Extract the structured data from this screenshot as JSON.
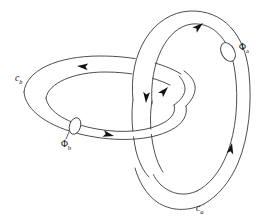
{
  "figure": {
    "background_color": "#ffffff",
    "line_color": "#3a3a3a",
    "arrow_color": "#111111"
  },
  "labels": {
    "loop_a": {
      "symbol": "c",
      "subscript": "a",
      "x": 198,
      "y": 209
    },
    "loop_b": {
      "symbol": "c",
      "subscript": "b",
      "x": 15,
      "y": 80
    },
    "flux_a": {
      "symbol": "Φ",
      "subscript": "a",
      "x": 240,
      "y": 48
    },
    "flux_b": {
      "symbol": "Φ",
      "subscript": "b",
      "x": 62,
      "y": 144
    }
  },
  "tori": [
    {
      "name": "torus-a",
      "description": "large tilted ring on the right, passes through torus-b",
      "loop_label": "c_a",
      "flux_label": "Φ_a",
      "cross_section": {
        "cx": 228,
        "cy": 52,
        "rx": 7,
        "ry": 10,
        "rotation": -28
      }
    },
    {
      "name": "torus-b",
      "description": "smaller horizontal ring on the left, passes through torus-a",
      "loop_label": "c_b",
      "flux_label": "Φ_b",
      "cross_section": {
        "cx": 75,
        "cy": 126,
        "rx": 6,
        "ry": 9,
        "rotation": 18
      }
    }
  ],
  "arrows": [
    {
      "name": "arrow-torus-a-top",
      "x": 200,
      "y": 25,
      "angle": -42,
      "belongs_to": "torus-a"
    },
    {
      "name": "arrow-torus-a-inner",
      "x": 163,
      "y": 92,
      "angle": -48,
      "belongs_to": "torus-a"
    },
    {
      "name": "arrow-torus-a-right",
      "x": 233,
      "y": 150,
      "angle": -78,
      "belongs_to": "torus-a"
    },
    {
      "name": "arrow-torus-a-descend",
      "x": 146,
      "y": 100,
      "angle": 92,
      "belongs_to": "torus-a"
    },
    {
      "name": "arrow-torus-b-top",
      "x": 81,
      "y": 66,
      "angle": 186,
      "belongs_to": "torus-b"
    },
    {
      "name": "arrow-torus-b-bottom",
      "x": 110,
      "y": 136,
      "angle": 12,
      "belongs_to": "torus-b"
    }
  ]
}
